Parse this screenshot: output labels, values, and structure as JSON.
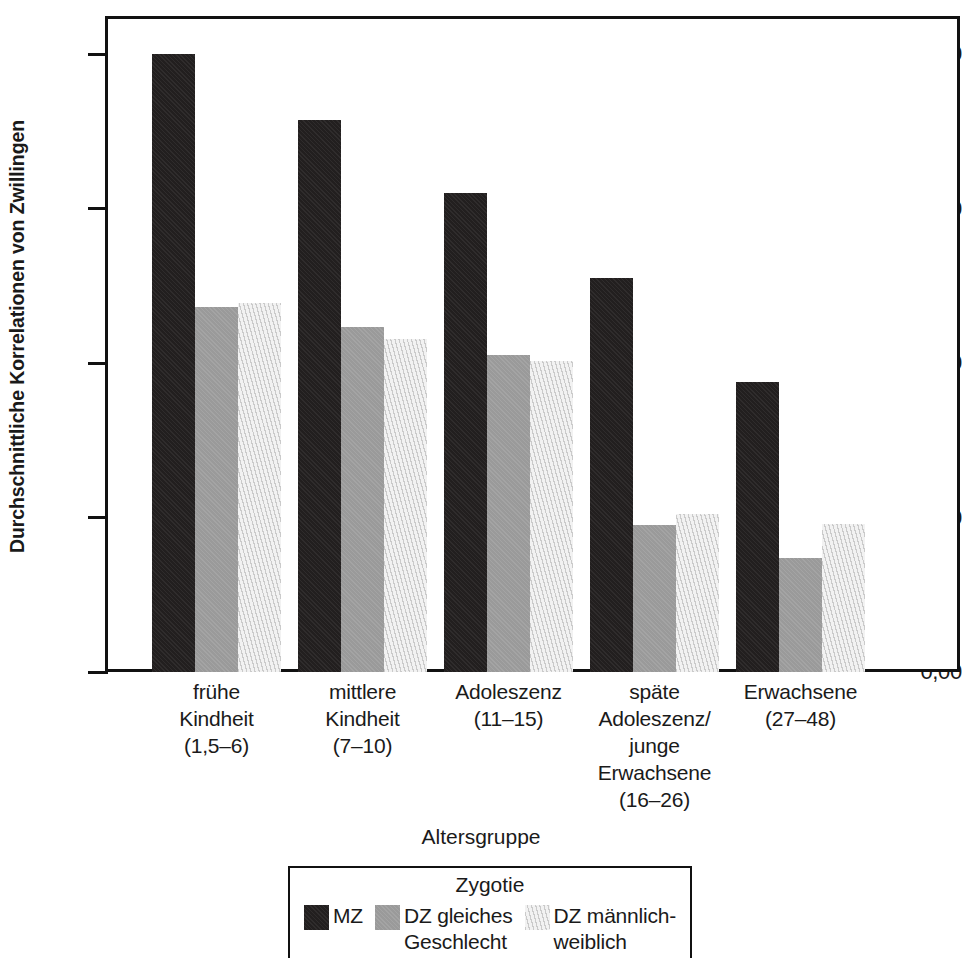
{
  "chart_data": {
    "type": "bar",
    "title": "",
    "xlabel": "Altersgruppe",
    "ylabel": "Durchschnittliche Korrelationen von Zwillingen",
    "ylim": [
      0.0,
      0.85
    ],
    "ytick_labels": [
      "0,80",
      "0,60",
      "0,40",
      "0,20",
      "0,00"
    ],
    "ytick_values": [
      0.8,
      0.6,
      0.4,
      0.2,
      0.0
    ],
    "grid": false,
    "legend_position": "bottom-center",
    "legend_title": "Zygotie",
    "categories": [
      "frühe\nKindheit\n(1,5–6)",
      "mittlere\nKindheit\n(7–10)",
      "Adoleszenz\n(11–15)",
      "späte\nAdoleszenz/\njunge\nErwachsene\n(16–26)",
      "Erwachsene\n(27–48)"
    ],
    "category_lines": [
      [
        "frühe",
        "Kindheit",
        "(1,5–6)"
      ],
      [
        "mittlere",
        "Kindheit",
        "(7–10)"
      ],
      [
        "Adoleszenz",
        "(11–15)"
      ],
      [
        "späte",
        "Adoleszenz/",
        "junge",
        "Erwachsene",
        "(16–26)"
      ],
      [
        "Erwachsene",
        "(27–48)"
      ]
    ],
    "series": [
      {
        "name": "MZ",
        "key": "mz",
        "color": "#221f1f",
        "values": [
          0.8,
          0.715,
          0.62,
          0.51,
          0.375
        ]
      },
      {
        "name": "DZ gleiches Geschlecht",
        "key": "dz-same",
        "color": "#9a9a9a",
        "values": [
          0.472,
          0.447,
          0.41,
          0.19,
          0.147
        ]
      },
      {
        "name": "DZ männlich-weiblich",
        "key": "dz-os",
        "color": "#f2f2f2",
        "values": [
          0.478,
          0.431,
          0.403,
          0.205,
          0.192
        ]
      }
    ]
  },
  "axis": {
    "y_title": "Durchschnittliche Korrelationen von Zwillingen",
    "x_title": "Altersgruppe",
    "ticks": [
      {
        "label": "0,80",
        "value": 0.8
      },
      {
        "label": "0,60",
        "value": 0.6
      },
      {
        "label": "0,40",
        "value": 0.4
      },
      {
        "label": "0,20",
        "value": 0.2
      },
      {
        "label": "0,00",
        "value": 0.0
      }
    ]
  },
  "legend": {
    "title": "Zygotie",
    "items": [
      {
        "label_lines": [
          "MZ"
        ],
        "label": "MZ",
        "color": "#221f1f"
      },
      {
        "label_lines": [
          "DZ gleiches",
          "Geschlecht"
        ],
        "label": "DZ gleiches Geschlecht",
        "color": "#9a9a9a"
      },
      {
        "label_lines": [
          "DZ männlich-",
          "weiblich"
        ],
        "label": "DZ männlich-weiblich",
        "color": "#f2f2f2"
      }
    ]
  },
  "colors": {
    "mz": "#221f1f",
    "dz_same": "#9a9a9a",
    "dz_os": "#f2f2f2",
    "axis": "#111111",
    "background": "#ffffff"
  }
}
